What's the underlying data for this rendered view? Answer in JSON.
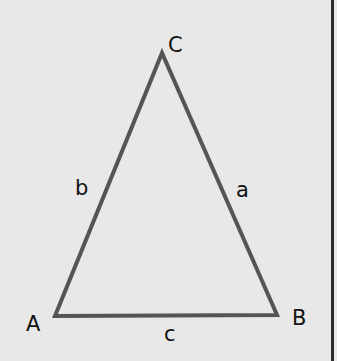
{
  "diagram": {
    "type": "triangle",
    "vertices": [
      {
        "name": "A",
        "label": "A"
      },
      {
        "name": "B",
        "label": "B"
      },
      {
        "name": "C",
        "label": "C"
      }
    ],
    "sides": [
      {
        "name": "a",
        "label": "a",
        "between": "B-C"
      },
      {
        "name": "b",
        "label": "b",
        "between": "A-C"
      },
      {
        "name": "c",
        "label": "c",
        "between": "A-B"
      }
    ],
    "colors": {
      "background": "#e8e8e8",
      "stroke": "#555555",
      "text": "#111111",
      "border": "#2a2a2a"
    }
  }
}
